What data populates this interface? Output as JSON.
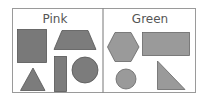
{
  "panels": [
    {
      "label": "Pink",
      "fill": "#7a7a7a",
      "shapes": [
        "square",
        "trapezoid",
        "triangle",
        "rectangle",
        "circle"
      ]
    },
    {
      "label": "Green",
      "fill": "#999999",
      "shapes": [
        "hexagon",
        "rectangle",
        "circle",
        "right-triangle"
      ]
    }
  ],
  "colors": {
    "border": "#999999",
    "stroke": "#555555"
  }
}
